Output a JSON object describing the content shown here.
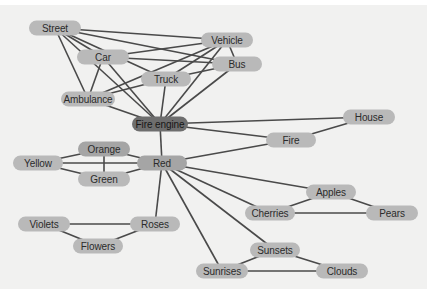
{
  "diagram": {
    "type": "semantic-network",
    "colors": {
      "background": "#f1f1f0",
      "node": "#b9b9b9",
      "node_highlight": "#6e6e6e",
      "edge": "#4a4a4a"
    },
    "nodes": [
      {
        "id": "street",
        "label": "Street",
        "x": 55,
        "y": 23,
        "w": 52
      },
      {
        "id": "vehicle",
        "label": "Vehicle",
        "x": 227,
        "y": 35,
        "w": 52
      },
      {
        "id": "car",
        "label": "Car",
        "x": 103,
        "y": 52,
        "w": 52
      },
      {
        "id": "bus",
        "label": "Bus",
        "x": 237,
        "y": 59,
        "w": 50
      },
      {
        "id": "truck",
        "label": "Truck",
        "x": 166,
        "y": 74,
        "w": 50
      },
      {
        "id": "ambulance",
        "label": "Ambulance",
        "x": 88,
        "y": 94,
        "w": 54
      },
      {
        "id": "fire_engine",
        "label": "Fire engine",
        "x": 160,
        "y": 119,
        "w": 56,
        "style": "dark"
      },
      {
        "id": "house",
        "label": "House",
        "x": 369,
        "y": 112,
        "w": 52
      },
      {
        "id": "fire",
        "label": "Fire",
        "x": 291,
        "y": 135,
        "w": 50
      },
      {
        "id": "orange",
        "label": "Orange",
        "x": 104,
        "y": 144,
        "w": 52,
        "style": "mid"
      },
      {
        "id": "yellow",
        "label": "Yellow",
        "x": 38,
        "y": 158,
        "w": 50
      },
      {
        "id": "red",
        "label": "Red",
        "x": 162,
        "y": 158,
        "w": 50,
        "style": "mid"
      },
      {
        "id": "green",
        "label": "Green",
        "x": 104,
        "y": 174,
        "w": 52
      },
      {
        "id": "apples",
        "label": "Apples",
        "x": 331,
        "y": 187,
        "w": 50
      },
      {
        "id": "cherries",
        "label": "Cherries",
        "x": 270,
        "y": 208,
        "w": 50
      },
      {
        "id": "pears",
        "label": "Pears",
        "x": 392,
        "y": 208,
        "w": 52
      },
      {
        "id": "violets",
        "label": "Violets",
        "x": 44,
        "y": 219,
        "w": 52
      },
      {
        "id": "roses",
        "label": "Roses",
        "x": 155,
        "y": 219,
        "w": 50
      },
      {
        "id": "flowers",
        "label": "Flowers",
        "x": 98,
        "y": 241,
        "w": 50
      },
      {
        "id": "sunsets",
        "label": "Sunsets",
        "x": 275,
        "y": 245,
        "w": 50
      },
      {
        "id": "sunrises",
        "label": "Sunrises",
        "x": 222,
        "y": 266,
        "w": 52
      },
      {
        "id": "clouds",
        "label": "Clouds",
        "x": 342,
        "y": 266,
        "w": 52
      }
    ],
    "edges": [
      [
        "street",
        "vehicle"
      ],
      [
        "street",
        "bus"
      ],
      [
        "street",
        "car"
      ],
      [
        "street",
        "truck"
      ],
      [
        "street",
        "ambulance"
      ],
      [
        "street",
        "fire_engine"
      ],
      [
        "car",
        "vehicle"
      ],
      [
        "car",
        "bus"
      ],
      [
        "car",
        "ambulance"
      ],
      [
        "car",
        "fire_engine"
      ],
      [
        "vehicle",
        "bus"
      ],
      [
        "vehicle",
        "truck"
      ],
      [
        "vehicle",
        "ambulance"
      ],
      [
        "vehicle",
        "fire_engine"
      ],
      [
        "bus",
        "truck"
      ],
      [
        "bus",
        "fire_engine"
      ],
      [
        "truck",
        "ambulance"
      ],
      [
        "truck",
        "fire_engine"
      ],
      [
        "ambulance",
        "fire_engine"
      ],
      [
        "fire_engine",
        "house"
      ],
      [
        "fire_engine",
        "fire"
      ],
      [
        "fire_engine",
        "red"
      ],
      [
        "house",
        "fire"
      ],
      [
        "red",
        "fire"
      ],
      [
        "red",
        "orange"
      ],
      [
        "red",
        "yellow"
      ],
      [
        "red",
        "green"
      ],
      [
        "red",
        "apples"
      ],
      [
        "red",
        "cherries"
      ],
      [
        "red",
        "sunsets"
      ],
      [
        "red",
        "sunrises"
      ],
      [
        "red",
        "roses"
      ],
      [
        "yellow",
        "orange"
      ],
      [
        "yellow",
        "green"
      ],
      [
        "orange",
        "green"
      ],
      [
        "apples",
        "cherries"
      ],
      [
        "apples",
        "pears"
      ],
      [
        "cherries",
        "pears"
      ],
      [
        "violets",
        "roses"
      ],
      [
        "violets",
        "flowers"
      ],
      [
        "roses",
        "flowers"
      ],
      [
        "sunsets",
        "sunrises"
      ],
      [
        "sunsets",
        "clouds"
      ],
      [
        "sunrises",
        "clouds"
      ]
    ]
  }
}
